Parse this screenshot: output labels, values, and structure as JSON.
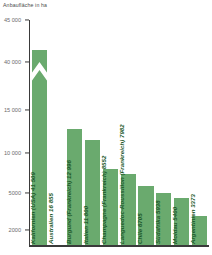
{
  "chart_data": {
    "type": "bar",
    "title": "Anbaufläche in ha",
    "xlabel": "",
    "ylabel": "Anbaufläche in ha",
    "unit": "ha",
    "grid": false,
    "legend": "none",
    "orientation": "vertical",
    "broken_axis": true,
    "axis_break_note": "Y-Achse unterbrochen zwischen 15 000 und 40 000",
    "ytick_labels": [
      "45 000",
      "40 000",
      "15 000",
      "10 000",
      "5000",
      "2000"
    ],
    "ytick_values": [
      45000,
      40000,
      15000,
      10000,
      5000,
      2000
    ],
    "ylim": [
      0,
      45000
    ],
    "categories": [
      "Kalifornien (USA)",
      "Australien",
      "Burgund (Frankreich)",
      "Italien",
      "Champagne (Frankreich)",
      "Languedoc-Roussillon (Frankreich)",
      "Chile",
      "Südafrika",
      "Moldau",
      "Argentinien"
    ],
    "values": [
      41509,
      16855,
      12996,
      11800,
      8552,
      7982,
      6705,
      5938,
      5400,
      3373
    ],
    "bars": [
      {
        "label": "Kalifornien (USA) 41 509",
        "name": "Kalifornien (USA)",
        "value": 41509,
        "value_text": "41 509"
      },
      {
        "label": "Australien 16 855",
        "name": "Australien",
        "value": 16855,
        "value_text": "16 855"
      },
      {
        "label": "Burgund (Frankreich) 12 996",
        "name": "Burgund (Frankreich)",
        "value": 12996,
        "value_text": "12 996"
      },
      {
        "label": "Italien 11 800",
        "name": "Italien",
        "value": 11800,
        "value_text": "11 800"
      },
      {
        "label": "Champagne (Frankreich) 8552",
        "name": "Champagne (Frankreich)",
        "value": 8552,
        "value_text": "8552"
      },
      {
        "label": "Languedoc-Roussillon (Frankreich) 7982",
        "name": "Languedoc-Roussillon (Frankreich)",
        "value": 7982,
        "value_text": "7982"
      },
      {
        "label": "Chile 6705",
        "name": "Chile",
        "value": 6705,
        "value_text": "6705"
      },
      {
        "label": "Südafrika 5938",
        "name": "Südafrika",
        "value": 5938,
        "value_text": "5938"
      },
      {
        "label": "Moldau 5400",
        "name": "Moldau",
        "value": 5400,
        "value_text": "5400"
      },
      {
        "label": "Argentinien 3373",
        "name": "Argentinien",
        "value": 3373,
        "value_text": "3373"
      }
    ]
  },
  "colors": {
    "bar_fill": "#6aaa6e",
    "bar_label": "#1d5a2b",
    "axis": "#3a3a3a",
    "tick_label": "#6d6d6d",
    "title": "#4a4a4a",
    "background": "#ffffff"
  }
}
